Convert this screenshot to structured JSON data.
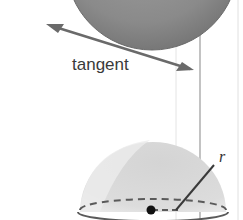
{
  "diagram": {
    "labels": {
      "tangent": "tangent",
      "radius": "r"
    },
    "elements": [
      {
        "id": "sphere",
        "description": "dark gray shaded sphere, partially cut off at top"
      },
      {
        "id": "tangent-line",
        "description": "double-headed arrow tangent to bottom of sphere"
      },
      {
        "id": "hemisphere",
        "description": "light gray translucent hemisphere with partially cut wedge"
      },
      {
        "id": "base-circle",
        "description": "ellipse at base of hemisphere, front solid, back dashed"
      },
      {
        "id": "center-point",
        "description": "black dot at center of base"
      },
      {
        "id": "radius-segment",
        "description": "line from center to surface labeled r"
      },
      {
        "id": "vertical-guides",
        "description": "thin vertical lines on right side"
      }
    ],
    "colors": {
      "sphere": "#8a8a8a",
      "sphere_dark": "#6e6e6e",
      "hemisphere": "#d9d9d9",
      "lines": "#555555",
      "arrow": "#6a6a6a"
    }
  }
}
